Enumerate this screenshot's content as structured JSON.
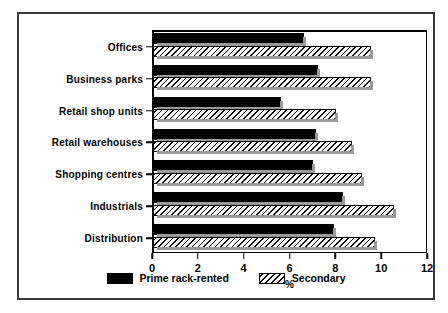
{
  "chart_data": {
    "type": "bar",
    "orientation": "horizontal",
    "title": "",
    "xlabel": "%",
    "ylabel": "",
    "xlim": [
      0,
      12
    ],
    "xticks": [
      0,
      2,
      4,
      6,
      8,
      10,
      12
    ],
    "xtick_labels": [
      "0",
      "2",
      "4",
      "6",
      "8",
      "10",
      "12"
    ],
    "grid": false,
    "legend_position": "bottom-center",
    "categories": [
      "Offices",
      "Business parks",
      "Retail shop units",
      "Retail warehouses",
      "Shopping centres",
      "Industrials",
      "Distribution"
    ],
    "series": [
      {
        "name": "Prime rack-rented",
        "style": "solid-black",
        "color": "#000000",
        "values": [
          6.6,
          7.2,
          5.6,
          7.1,
          7.0,
          8.3,
          7.9
        ]
      },
      {
        "name": "Secondary",
        "style": "diagonal-hatch",
        "color": "#ffffff",
        "values": [
          9.5,
          9.5,
          8.0,
          8.7,
          9.1,
          10.5,
          9.7
        ]
      }
    ]
  },
  "legend": {
    "entries": [
      {
        "label": "Prime rack-rented",
        "swatch": "solid"
      },
      {
        "label": "Secondary",
        "swatch": "hatch"
      }
    ]
  }
}
